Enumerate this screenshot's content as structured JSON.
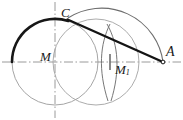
{
  "figure": {
    "colors": {
      "thin_line": "#8c8c8c",
      "thick_line": "#1a1a1a",
      "axis_line": "#9a9a9a",
      "label_color": "#1a1a1a",
      "background": "#ffffff"
    },
    "axes": {
      "horizontal": {
        "y": 62,
        "x1": 2,
        "x2": 181,
        "style": "dash-dot"
      },
      "vertical": {
        "x": 55,
        "y1": 2,
        "y2": 118,
        "style": "dash-dot"
      }
    },
    "points": [
      {
        "name": "C",
        "label": "C",
        "x": 68,
        "y": 18
      },
      {
        "name": "M",
        "label": "M",
        "x": 55,
        "y": 62
      },
      {
        "name": "M1",
        "label": "M",
        "sub": "1",
        "x": 110,
        "y": 62
      },
      {
        "name": "A",
        "label": "A",
        "x": 163,
        "y": 62
      }
    ],
    "labels": {
      "C": "C",
      "M": "M",
      "M1_base": "M",
      "M1_sub": "1",
      "A": "A"
    },
    "circles": [
      {
        "name": "primary-circle",
        "cx": 55,
        "cy": 62,
        "r": 43,
        "stroke": "thin"
      },
      {
        "name": "secondary-circle",
        "cx": 96,
        "cy": 62,
        "r": 43,
        "stroke": "thin"
      }
    ],
    "arcs": [
      {
        "name": "bold-arc-on-primary-circle",
        "cx": 55,
        "cy": 62,
        "r": 43,
        "from_deg": 180,
        "to_deg": 72,
        "stroke": "thick"
      },
      {
        "name": "large-arc-C-to-A",
        "from": "C",
        "to": "A",
        "stroke": "thin"
      },
      {
        "name": "construction-arc-left",
        "stroke": "thin"
      },
      {
        "name": "construction-arc-right",
        "stroke": "thin"
      }
    ],
    "segments": [
      {
        "name": "chord-C-A",
        "from": "C",
        "to": "A",
        "stroke": "thick"
      }
    ],
    "tick_marks": [
      {
        "name": "tick-at-M1",
        "x": 110,
        "y": 62
      }
    ]
  }
}
